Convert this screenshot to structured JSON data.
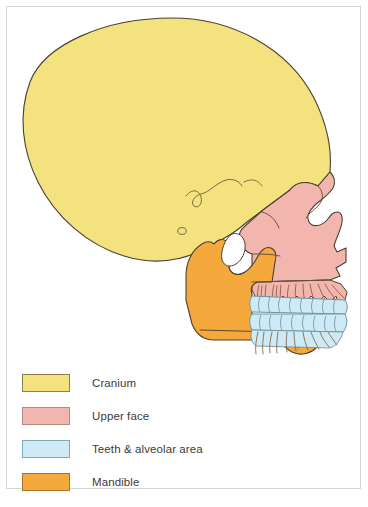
{
  "figure": {
    "background_color": "#ffffff",
    "frame_color": "#d6d6d6"
  },
  "colors": {
    "cranium": "#F3E27E",
    "upper_face": "#F3B6AE",
    "teeth": "#CDEAF5",
    "mandible": "#F5A83C",
    "outline": "#4a4034",
    "tooth_outline": "#6f93a6",
    "suture_outline": "#7a6a40"
  },
  "diagram": {
    "regions": [
      {
        "id": "cranium",
        "label": "Cranium",
        "color": "#F3E27E"
      },
      {
        "id": "upper-face",
        "label": "Upper face",
        "color": "#F3B6AE"
      },
      {
        "id": "teeth",
        "label": "Teeth & alveolar area",
        "color": "#CDEAF5"
      },
      {
        "id": "mandible",
        "label": "Mandible",
        "color": "#F5A83C"
      }
    ]
  },
  "legend": {
    "items": [
      {
        "label": "Cranium",
        "color": "#F3E27E",
        "border": "#8a7f52"
      },
      {
        "label": "Upper face",
        "color": "#F3B6AE",
        "border": "#b08a85"
      },
      {
        "label": "Teeth & alveolar area",
        "color": "#CDEAF5",
        "border": "#7fa8bb"
      },
      {
        "label": "Mandible",
        "color": "#F5A83C",
        "border": "#a8742a"
      }
    ]
  }
}
